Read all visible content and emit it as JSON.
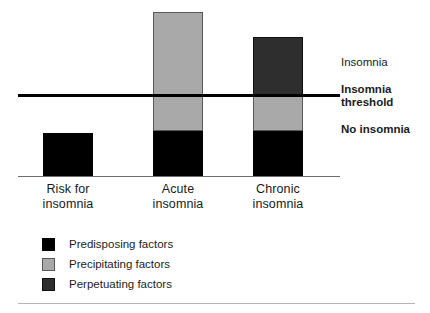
{
  "chart_data": {
    "type": "bar",
    "subtype": "stacked",
    "title": "",
    "subtitle": "",
    "xlabel": "",
    "ylabel": "",
    "categories": [
      "Risk for insomnia",
      "Acute insomnia",
      "Chronic insomnia"
    ],
    "category_lines": [
      [
        "Risk for",
        "insomnia"
      ],
      [
        "Acute",
        "insomnia"
      ],
      [
        "Chronic",
        "insomnia"
      ]
    ],
    "series": [
      {
        "name": "Predisposing factors",
        "color": "#000000",
        "values": [
          26,
          27,
          27
        ]
      },
      {
        "name": "Precipitating factors",
        "color": "#a9a9a9",
        "values": [
          0,
          73,
          21
        ]
      },
      {
        "name": "Perpetuating factors",
        "color": "#2e2e2e",
        "values": [
          0,
          0,
          36
        ]
      }
    ],
    "totals": [
      26,
      100,
      84
    ],
    "ylim": [
      0,
      100
    ],
    "grid": false,
    "legend_position": "bottom-left",
    "threshold": {
      "value": 49,
      "label": "Insomnia threshold",
      "color": "#000000"
    },
    "annotations": [
      {
        "name": "above-threshold-zone",
        "text": "Insomnia"
      },
      {
        "name": "threshold-marker",
        "text": "Insomnia threshold"
      },
      {
        "name": "below-threshold-zone",
        "text": "No insomnia"
      }
    ]
  },
  "zones": {
    "insomnia": "Insomnia",
    "threshold_line1": "Insomnia",
    "threshold_line2": "threshold",
    "no_insomnia": "No insomnia"
  },
  "legend": {
    "items": [
      {
        "label": "Predisposing factors",
        "color": "#000000"
      },
      {
        "label": "Precipitating factors",
        "color": "#a9a9a9"
      },
      {
        "label": "Perpetuating factors",
        "color": "#2e2e2e"
      }
    ]
  }
}
